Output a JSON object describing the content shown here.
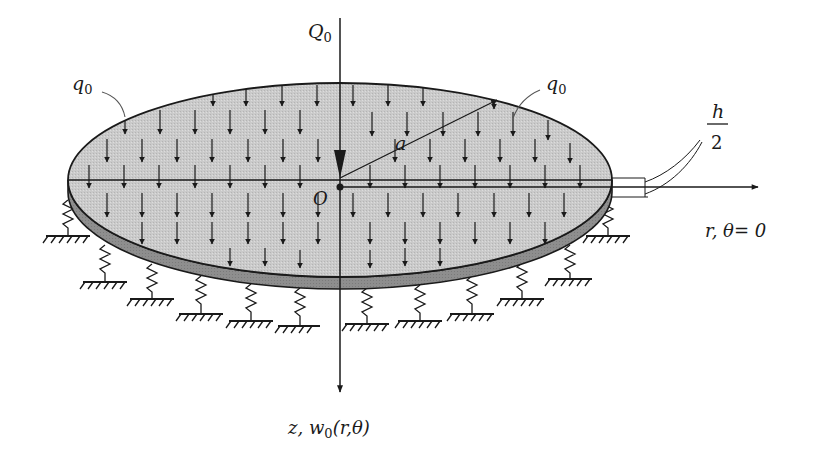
{
  "figure": {
    "type": "engineering-diagram",
    "colors": {
      "plate_top": "#c8c8c8",
      "plate_edge": "#8a8a8a",
      "ink": "#1a1a1a",
      "background": "#ffffff"
    }
  },
  "labels": {
    "point_load": {
      "symbol": "Q",
      "subscript": "0"
    },
    "distributed_load_left": {
      "symbol": "q",
      "subscript": "0"
    },
    "distributed_load_right": {
      "symbol": "q",
      "subscript": "0"
    },
    "radius": "a",
    "origin": "O",
    "thickness_num": "h",
    "thickness_den": "2",
    "r_axis": "r,  θ= 0",
    "z_axis_prefix": "z, w",
    "z_axis_sub": "0",
    "z_axis_suffix": "(r,θ)"
  },
  "elements": {
    "springs_count": 11,
    "load_arrow_rows": 5
  }
}
